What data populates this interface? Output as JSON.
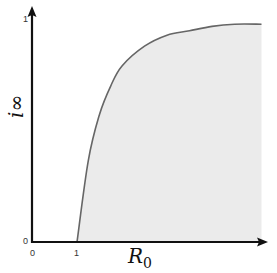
{
  "chart_data": {
    "type": "area",
    "title": "",
    "xlabel": "R_0",
    "ylabel": "i_∞",
    "x_ticks": [
      "0",
      "1"
    ],
    "y_ticks": [
      "0",
      "1"
    ],
    "xlim": [
      0,
      5.1
    ],
    "ylim": [
      0,
      1
    ],
    "grid": false,
    "legend": null,
    "x": [
      0,
      0.5,
      1.0,
      1.25,
      1.5,
      1.75,
      2.0,
      2.5,
      3.0,
      3.5,
      4.0,
      4.5,
      5.1
    ],
    "series": [
      {
        "name": "i_∞",
        "values": [
          0,
          0,
          0,
          0.37,
          0.58,
          0.71,
          0.8,
          0.89,
          0.94,
          0.96,
          0.98,
          0.99,
          0.99
        ]
      }
    ],
    "annotations": [
      "Shaded region under curve for R_0 > 1"
    ],
    "colors": {
      "fill": "#ebebeb",
      "curve": "#666666",
      "axis": "#111111"
    }
  },
  "labels": {
    "x_tick_0": "0",
    "x_tick_1": "1",
    "y_tick_0": "0",
    "y_tick_1": "1",
    "x_axis_main": "R",
    "x_axis_sub": "0",
    "y_axis": "i∞"
  }
}
